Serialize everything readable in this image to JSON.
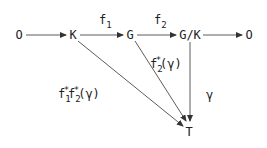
{
  "diagram": {
    "type": "commutative-diagram",
    "nodes": [
      {
        "id": "zero_left",
        "label": "O",
        "x": 19,
        "y": 35
      },
      {
        "id": "K",
        "label": "K",
        "x": 73,
        "y": 35
      },
      {
        "id": "G",
        "label": "G",
        "x": 130,
        "y": 35
      },
      {
        "id": "GK",
        "label": "G/K",
        "x": 190,
        "y": 35
      },
      {
        "id": "zero_right",
        "label": "O",
        "x": 248,
        "y": 35
      },
      {
        "id": "T",
        "label": "T",
        "x": 189,
        "y": 130
      }
    ],
    "edges": [
      {
        "from": "zero_left",
        "to": "K",
        "label": ""
      },
      {
        "from": "K",
        "to": "G",
        "label": "f1"
      },
      {
        "from": "G",
        "to": "GK",
        "label": "f2"
      },
      {
        "from": "GK",
        "to": "zero_right",
        "label": ""
      },
      {
        "from": "K",
        "to": "T",
        "label": "f1*f2*(γ)"
      },
      {
        "from": "G",
        "to": "T",
        "label": "f2*(γ)"
      },
      {
        "from": "GK",
        "to": "T",
        "label": "γ"
      }
    ],
    "labels": {
      "f1": {
        "base": "f",
        "sub": "1"
      },
      "f2": {
        "base": "f",
        "sub": "2"
      },
      "f2star": {
        "base": "f",
        "sub": "2",
        "sup": "*",
        "arg": "(γ)"
      },
      "f1star": {
        "base": "f",
        "sub": "1",
        "sup": "*"
      },
      "f1f2star_tail": {
        "base": "f",
        "sub": "2",
        "sup": "*",
        "arg": "(γ)"
      },
      "gamma": "γ"
    },
    "stroke_color": "#333333"
  }
}
